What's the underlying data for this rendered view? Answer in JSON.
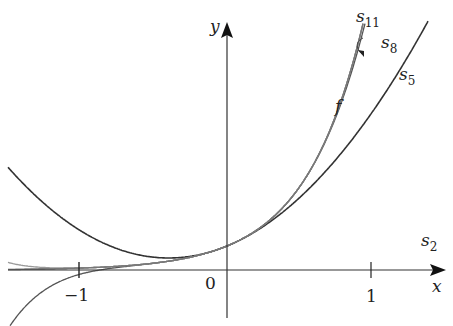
{
  "chart_data": {
    "type": "line",
    "title": "",
    "xlabel": "x",
    "ylabel": "y",
    "x_ticks": [
      "-1",
      "0",
      "1"
    ],
    "xlim": [
      -1.5,
      1.45
    ],
    "grid": false,
    "function": "f(x)",
    "series": [
      {
        "name": "f",
        "label": "f",
        "color": "#555555",
        "description": "exponential curve, f(0)=1"
      },
      {
        "name": "s2",
        "label": "s2",
        "color": "#333333",
        "degree": 2
      },
      {
        "name": "s5",
        "label": "s5",
        "color": "#555555",
        "degree": 5
      },
      {
        "name": "s8",
        "label": "s8",
        "color": "#999999",
        "degree": 8
      },
      {
        "name": "s11",
        "label": "s11",
        "color": "#777777",
        "degree": 11
      }
    ],
    "annotations": [
      "arrow from s11 label to s11 curve"
    ]
  },
  "labels": {
    "y_axis": "y",
    "x_axis": "x",
    "origin": "0",
    "tick_neg1": "−1",
    "tick_1": "1",
    "f": "f",
    "s_base": "s",
    "s11_sub": "11",
    "s8_sub": "8",
    "s5_sub": "5",
    "s2_sub": "2"
  }
}
